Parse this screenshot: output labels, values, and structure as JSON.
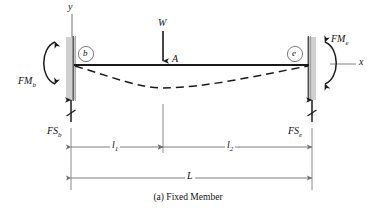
{
  "figure": {
    "caption": "(a) Fixed Member",
    "axes": {
      "y_label": "y",
      "x_label": "x"
    },
    "nodes": [
      {
        "id": "b",
        "label": "b",
        "side": "left"
      },
      {
        "id": "e",
        "label": "e",
        "side": "right"
      }
    ],
    "point_label": "A",
    "loads": {
      "applied_load": {
        "label": "W",
        "direction": "down",
        "at": "A"
      },
      "point_label": "A"
    },
    "reactions": [
      {
        "name": "fixed-end-moment-b",
        "label": "FM",
        "subscript": "b",
        "sense": "counterclockwise"
      },
      {
        "name": "fixed-end-moment-e",
        "label": "FM",
        "subscript": "e",
        "sense": "clockwise"
      },
      {
        "name": "fixed-end-shear-b",
        "label": "FS",
        "subscript": "b",
        "direction": "up"
      },
      {
        "name": "fixed-end-shear-e",
        "label": "FS",
        "subscript": "e",
        "direction": "up"
      }
    ],
    "dimensions": [
      {
        "name": "l1",
        "label": "l",
        "subscript": "1"
      },
      {
        "name": "l2",
        "label": "l",
        "subscript": "2"
      },
      {
        "name": "L",
        "label": "L",
        "subscript": ""
      }
    ],
    "colors": {
      "line": "#1a1a1a",
      "wall_fill": "#d0d0d0",
      "axis": "#9a9a9a",
      "dimension": "#6e6e6e",
      "deflection": "#1a1a1a"
    }
  }
}
